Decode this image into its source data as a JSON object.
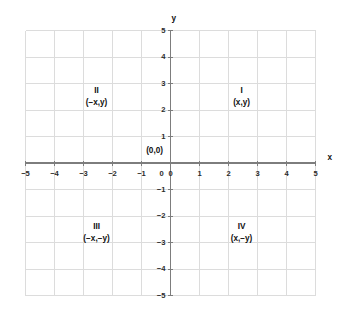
{
  "chart_data": {
    "type": "scatter",
    "title": "",
    "xlabel": "x",
    "ylabel": "y",
    "xlim": [
      -5,
      5
    ],
    "ylim": [
      -5,
      5
    ],
    "grid": true,
    "grid_step": 1,
    "legend": "none",
    "x_ticks": [
      "−5",
      "−4",
      "−3",
      "−2",
      "−1",
      "0",
      "1",
      "2",
      "3",
      "4",
      "5"
    ],
    "x_tick_values": [
      -5,
      -4,
      -3,
      -2,
      -1,
      0,
      1,
      2,
      3,
      4,
      5
    ],
    "y_ticks": [
      "−5",
      "−4",
      "−3",
      "−2",
      "−1",
      "0",
      "1",
      "2",
      "3",
      "4",
      "5"
    ],
    "y_tick_values": [
      -5,
      -4,
      -3,
      -2,
      -1,
      0,
      1,
      2,
      3,
      4,
      5
    ],
    "series": [],
    "values": [],
    "categories": [],
    "annotations": [
      {
        "name": "origin",
        "text": "(0,0)",
        "x": -0.55,
        "y": 0.45
      },
      {
        "name": "quadrant-1-roman",
        "text": "I",
        "x": 2.45,
        "y": 2.72
      },
      {
        "name": "quadrant-1-coord",
        "text": "(x,y)",
        "x": 2.45,
        "y": 2.27
      },
      {
        "name": "quadrant-2-roman",
        "text": "II",
        "x": -2.55,
        "y": 2.72
      },
      {
        "name": "quadrant-2-coord",
        "text": "(−x,y)",
        "x": -2.55,
        "y": 2.27
      },
      {
        "name": "quadrant-3-roman",
        "text": "III",
        "x": -2.55,
        "y": -2.4
      },
      {
        "name": "quadrant-3-coord",
        "text": "(−x,−y)",
        "x": -2.55,
        "y": -2.85
      },
      {
        "name": "quadrant-4-roman",
        "text": "IV",
        "x": 2.45,
        "y": -2.4
      },
      {
        "name": "quadrant-4-coord",
        "text": "(x,−y)",
        "x": 2.45,
        "y": -2.85
      }
    ]
  },
  "axis": {
    "x_title": "x",
    "y_title": "y"
  },
  "colors": {
    "background": "#ffffff",
    "grid": "#dcdcdc",
    "axis": "#7d7d7d",
    "text": "#111111"
  }
}
